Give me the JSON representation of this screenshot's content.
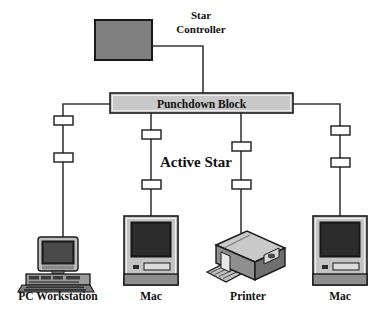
{
  "diagram": {
    "title_text": "Active Star",
    "nodes": {
      "star_controller": {
        "label_line1": "Star",
        "label_line2": "Controller",
        "shape": "filled-rectangle",
        "fill": "#808080",
        "stroke": "#1a1a1a"
      },
      "punchdown_block": {
        "label": "Punchdown Block",
        "shape": "rectangle",
        "fill": "#c8c8c8",
        "stroke": "#1a1a1a"
      }
    },
    "center_label": "Active Star",
    "devices": [
      {
        "name": "pc-workstation",
        "label": "PC Workstation",
        "icon": "desktop-computer-icon"
      },
      {
        "name": "mac-left",
        "label": "Mac",
        "icon": "macintosh-icon"
      },
      {
        "name": "printer",
        "label": "Printer",
        "icon": "laser-printer-icon"
      },
      {
        "name": "mac-right",
        "label": "Mac",
        "icon": "macintosh-icon"
      }
    ],
    "connector_count": 8,
    "connector_label": "cable-connector",
    "colors": {
      "line": "#3a3a3a",
      "controller_fill": "#808080",
      "block_fill": "#c8c8c8",
      "connector_fill": "#ffffff",
      "screen_dark": "#1e1e1e",
      "case_light": "#d0d0d0",
      "case_mid": "#9a9a9a",
      "case_dark": "#6e6e6e",
      "text": "#111111"
    }
  }
}
